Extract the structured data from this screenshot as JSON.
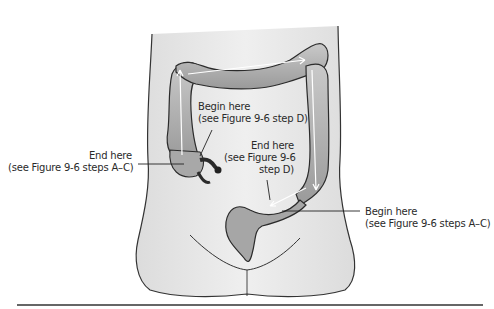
{
  "figure": {
    "labels": [
      {
        "id": "begin-d",
        "line1": "Begin here",
        "line2": "(see Figure 9-6 step D)"
      },
      {
        "id": "end-ac",
        "line1": "End here",
        "line2": "(see Figure 9-6 steps A–C)"
      },
      {
        "id": "end-d",
        "line1": "End here",
        "line2": "(see Figure 9-6",
        "line3": "step D)"
      },
      {
        "id": "begin-ac",
        "line1": "Begin here",
        "line2": "(see Figure 9-6 steps A–C)"
      }
    ],
    "colors": {
      "body_fill": "#e9e9e9",
      "colon_fill": "#b9b9b9",
      "colon_shade": "#8c8c8c",
      "outline": "#2b2b2b",
      "arrow": "#ffffff",
      "rule": "#333333"
    }
  }
}
